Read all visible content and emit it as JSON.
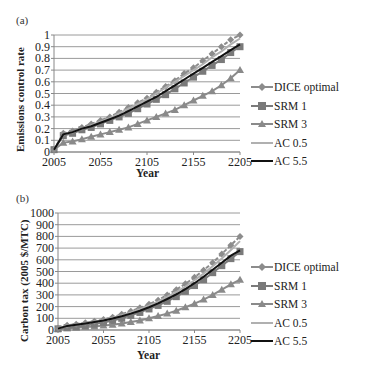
{
  "chart_data": [
    {
      "panel": "(a)",
      "type": "line",
      "title": "",
      "xlabel": "Year",
      "ylabel": "Emissions control rate",
      "x": [
        2005,
        2015,
        2025,
        2035,
        2045,
        2055,
        2065,
        2075,
        2085,
        2095,
        2105,
        2115,
        2125,
        2135,
        2145,
        2155,
        2165,
        2175,
        2185,
        2195,
        2205
      ],
      "xticks": [
        2005,
        2055,
        2105,
        2155,
        2205
      ],
      "yticks": [
        0,
        0.1,
        0.2,
        0.3,
        0.4,
        0.5,
        0.6,
        0.7,
        0.8,
        0.9,
        1
      ],
      "ytick_labels": [
        "0",
        "0.1",
        "0.2",
        "0.3",
        "0.4",
        "0.5",
        "0.6",
        "0.7",
        "0.8",
        "0.9",
        "1"
      ],
      "ylim": [
        0,
        1
      ],
      "xlim": [
        2005,
        2205
      ],
      "grid": true,
      "legend_position": "right",
      "series": [
        {
          "name": "DICE optimal",
          "marker": "diamond",
          "color": "#8c8c8c",
          "dashed": true,
          "values": [
            0.02,
            0.16,
            0.18,
            0.21,
            0.24,
            0.27,
            0.3,
            0.34,
            0.38,
            0.42,
            0.46,
            0.51,
            0.56,
            0.61,
            0.67,
            0.72,
            0.78,
            0.84,
            0.9,
            0.96,
            1.0
          ]
        },
        {
          "name": "SRM 1",
          "marker": "square",
          "color": "#7a7a7a",
          "dashed": false,
          "values": [
            0.02,
            0.14,
            0.16,
            0.19,
            0.21,
            0.24,
            0.27,
            0.3,
            0.33,
            0.37,
            0.41,
            0.45,
            0.49,
            0.54,
            0.59,
            0.64,
            0.69,
            0.74,
            0.79,
            0.85,
            0.9
          ]
        },
        {
          "name": "SRM 3",
          "marker": "triangle",
          "color": "#8a8a8a",
          "dashed": false,
          "values": [
            0.02,
            0.08,
            0.09,
            0.11,
            0.13,
            0.15,
            0.17,
            0.19,
            0.21,
            0.24,
            0.27,
            0.3,
            0.33,
            0.36,
            0.4,
            0.44,
            0.48,
            0.52,
            0.57,
            0.63,
            0.7
          ]
        },
        {
          "name": "AC 0.5",
          "marker": "none",
          "color": "#b0b0b0",
          "dashed": false,
          "values": [
            0.02,
            0.15,
            0.17,
            0.2,
            0.23,
            0.26,
            0.29,
            0.33,
            0.37,
            0.41,
            0.45,
            0.5,
            0.55,
            0.6,
            0.65,
            0.7,
            0.75,
            0.81,
            0.86,
            0.92,
            0.97
          ]
        },
        {
          "name": "AC 5.5",
          "marker": "none",
          "color": "#111111",
          "dashed": false,
          "values": [
            0.02,
            0.15,
            0.17,
            0.2,
            0.22,
            0.25,
            0.28,
            0.31,
            0.35,
            0.39,
            0.43,
            0.47,
            0.52,
            0.57,
            0.62,
            0.67,
            0.72,
            0.77,
            0.82,
            0.87,
            0.92
          ]
        }
      ]
    },
    {
      "panel": "(b)",
      "type": "line",
      "title": "",
      "xlabel": "Year",
      "ylabel": "Carbon tax (2005 $/MTC)",
      "x": [
        2005,
        2015,
        2025,
        2035,
        2045,
        2055,
        2065,
        2075,
        2085,
        2095,
        2105,
        2115,
        2125,
        2135,
        2145,
        2155,
        2165,
        2175,
        2185,
        2195,
        2205
      ],
      "xticks": [
        2005,
        2055,
        2105,
        2155,
        2205
      ],
      "yticks": [
        0,
        100,
        200,
        300,
        400,
        500,
        600,
        700,
        800,
        900,
        1000
      ],
      "ytick_labels": [
        "0",
        "100",
        "200",
        "300",
        "400",
        "500",
        "600",
        "700",
        "800",
        "900",
        "1000"
      ],
      "ylim": [
        0,
        1000
      ],
      "xlim": [
        2005,
        2205
      ],
      "grid": true,
      "legend_position": "right",
      "series": [
        {
          "name": "DICE optimal",
          "marker": "diamond",
          "color": "#8c8c8c",
          "dashed": true,
          "values": [
            15,
            40,
            50,
            62,
            75,
            90,
            110,
            135,
            160,
            190,
            220,
            255,
            300,
            345,
            395,
            450,
            510,
            575,
            650,
            725,
            800
          ]
        },
        {
          "name": "SRM 1",
          "marker": "square",
          "color": "#7a7a7a",
          "dashed": false,
          "values": [
            10,
            20,
            28,
            38,
            50,
            65,
            82,
            100,
            125,
            150,
            180,
            210,
            245,
            285,
            330,
            380,
            430,
            490,
            550,
            610,
            670
          ]
        },
        {
          "name": "SRM 3",
          "marker": "triangle",
          "color": "#8a8a8a",
          "dashed": false,
          "values": [
            8,
            15,
            20,
            25,
            30,
            38,
            45,
            55,
            68,
            82,
            100,
            120,
            140,
            165,
            195,
            225,
            260,
            300,
            345,
            390,
            430
          ]
        },
        {
          "name": "AC 0.5",
          "marker": "none",
          "color": "#b0b0b0",
          "dashed": false,
          "values": [
            14,
            38,
            48,
            60,
            72,
            86,
            104,
            126,
            150,
            178,
            208,
            242,
            282,
            325,
            372,
            425,
            482,
            545,
            612,
            685,
            760
          ]
        },
        {
          "name": "AC 5.5",
          "marker": "none",
          "color": "#111111",
          "dashed": false,
          "values": [
            12,
            35,
            45,
            56,
            68,
            82,
            98,
            118,
            140,
            165,
            195,
            228,
            265,
            305,
            350,
            400,
            455,
            515,
            575,
            635,
            680
          ]
        }
      ]
    }
  ],
  "panels": {
    "a": {
      "label": "(a)",
      "ylabel": "Emissions control rate",
      "xlabel": "Year"
    },
    "b": {
      "label": "(b)",
      "ylabel": "Carbon tax (2005 $/MTC)",
      "xlabel": "Year"
    }
  },
  "legend": [
    "DICE optimal",
    "SRM 1",
    "SRM 3",
    "AC 0.5",
    "AC 5.5"
  ]
}
